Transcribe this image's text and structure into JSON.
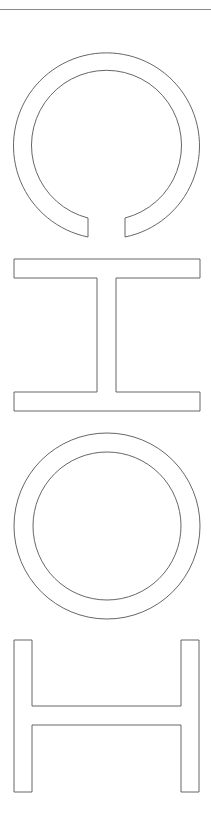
{
  "letters": [
    {
      "char": "C",
      "shape": "ring-with-bottom-gap"
    },
    {
      "char": "H",
      "shape": "i-beam"
    },
    {
      "char": "O",
      "shape": "ring"
    },
    {
      "char": "H",
      "shape": "h-beam"
    }
  ],
  "colors": {
    "background": "#ffffff",
    "stroke": "#555555",
    "rule": "#8a8a8a"
  }
}
